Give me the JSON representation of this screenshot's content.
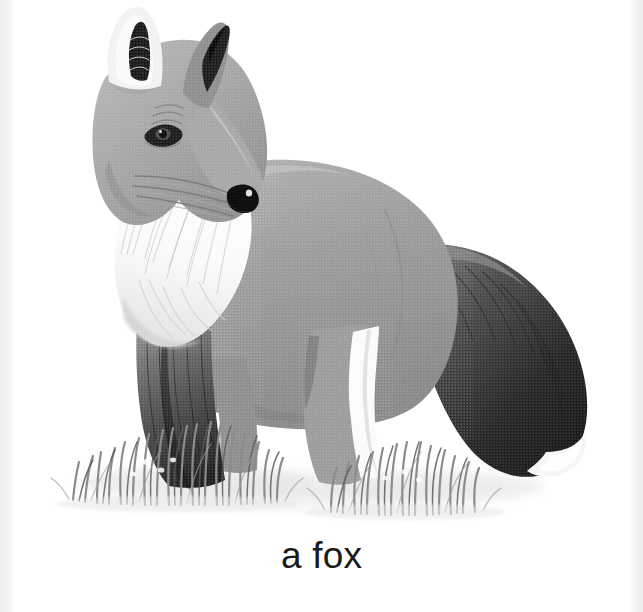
{
  "card": {
    "caption": "a fox",
    "subject": "fox",
    "illustration_style": "grayscale halftone print illustration",
    "background_color": "#ffffff"
  },
  "margins": {
    "left_strip_color": "#eceef0",
    "right_strip_color": "#eceef0"
  },
  "palette": {
    "body_mid_gray": "#9a9a9a",
    "body_light_gray": "#b4b4b4",
    "body_shadow_gray": "#7d7d7d",
    "dark_gray": "#4a4a4a",
    "near_black": "#1d1d1d",
    "black": "#111111",
    "white_fur": "#fbfbfb",
    "white_fur_shade": "#e6e6e6",
    "grass_gray": "#8c8c8c",
    "grass_dark": "#5c5c5c",
    "ground_shadow": "#e9e9e9",
    "caption_color": "#1b1b1b"
  },
  "illustration_parts": [
    {
      "name": "left-ear",
      "label": "left ear",
      "tone": "white-tufted with dark inner stripe"
    },
    {
      "name": "right-ear",
      "label": "right ear",
      "tone": "dark tipped"
    },
    {
      "name": "head",
      "label": "head",
      "tone": "mid gray"
    },
    {
      "name": "eye",
      "label": "eye",
      "tone": "black almond with highlight"
    },
    {
      "name": "muzzle",
      "label": "muzzle",
      "tone": "light gray to white"
    },
    {
      "name": "nose",
      "label": "nose",
      "tone": "black with white highlight"
    },
    {
      "name": "whiskers",
      "label": "whiskers",
      "tone": "fine gray strokes"
    },
    {
      "name": "chest-ruff",
      "label": "white chest ruff",
      "tone": "white radiating fur"
    },
    {
      "name": "body",
      "label": "body",
      "tone": "mid gray halftone"
    },
    {
      "name": "front-legs",
      "label": "front legs",
      "tone": "dark gray to black"
    },
    {
      "name": "hind-legs",
      "label": "hind legs",
      "tone": "mid gray with white blaze"
    },
    {
      "name": "tail",
      "label": "bushy tail",
      "tone": "dark with white tip"
    },
    {
      "name": "grass-left",
      "label": "left grass tuft",
      "tone": "gray blades"
    },
    {
      "name": "grass-right",
      "label": "right grass tuft",
      "tone": "gray blades"
    },
    {
      "name": "ground-shadow",
      "label": "ground shadow",
      "tone": "very light gray"
    }
  ]
}
